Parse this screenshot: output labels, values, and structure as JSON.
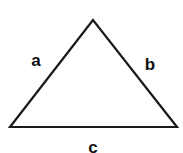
{
  "diagram": {
    "type": "triangle",
    "stroke_color": "#1a1a1a",
    "vertices": {
      "apex": [
        93,
        20
      ],
      "bottom_left": [
        10,
        127
      ],
      "bottom_right": [
        177,
        127
      ]
    },
    "labels": {
      "left_side": "a",
      "right_side": "b",
      "base": "c"
    }
  }
}
